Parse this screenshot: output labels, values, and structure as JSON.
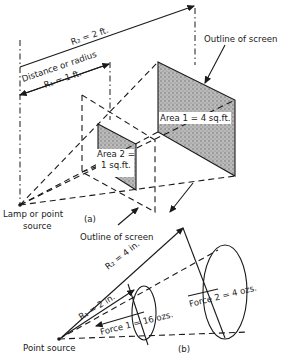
{
  "figure": {
    "panel_a": {
      "caption": "(a)",
      "r2_label": "R₂ = 2 ft.",
      "distance_label": "Distance or radius",
      "r1_label": "R₁ = 1 ft.",
      "outline_top_label": "Outline of screen",
      "area1_label": "Area 1 = 4 sq.ft.",
      "area2_line1": "Area 2 =",
      "area2_line2": "1 sq.ft.",
      "source_line1": "Lamp or point",
      "source_line2": "source",
      "outline_bottom_label": "Outline of screen"
    },
    "panel_b": {
      "caption": "(b)",
      "r2_label": "R₂ = 4 in.",
      "r1_label": "R₁ = 2 in.",
      "force1_label": "Force 1 = 16 ozs.",
      "force2_label": "Force 2 = 4 ozs.",
      "source_label": "Point source"
    },
    "colors": {
      "ink": "#1a1a1a",
      "shading": "#9a9a9a",
      "background": "#ffffff"
    }
  }
}
